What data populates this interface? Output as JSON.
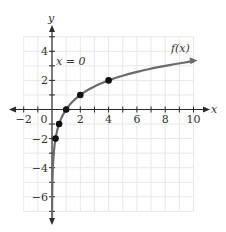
{
  "chart_data": {
    "type": "line",
    "title": "",
    "function_label": "f(x)",
    "asymptote_label": "x = 0",
    "xlabel": "x",
    "ylabel": "y",
    "xlim": [
      -2,
      10
    ],
    "ylim": [
      -7,
      5
    ],
    "x_ticks": [
      -2,
      -1,
      0,
      1,
      2,
      3,
      4,
      5,
      6,
      7,
      8,
      9,
      10
    ],
    "x_tick_labels": [
      "-2",
      "0",
      "2",
      "4",
      "6",
      "8",
      "10"
    ],
    "x_tick_label_values": [
      -2,
      0,
      2,
      4,
      6,
      8,
      10
    ],
    "y_ticks": [
      -7,
      -6,
      -5,
      -4,
      -3,
      -2,
      -1,
      0,
      1,
      2,
      3,
      4,
      5
    ],
    "y_tick_labels": [
      "4",
      "2",
      "-2",
      "-4",
      "-6"
    ],
    "y_tick_label_values": [
      4,
      2,
      -2,
      -4,
      -6
    ],
    "grid": true,
    "series": [
      {
        "name": "f(x)",
        "description": "logarithmic curve f(x) = log2(x)",
        "points": [
          {
            "x": 0.25,
            "y": -2
          },
          {
            "x": 0.5,
            "y": -1
          },
          {
            "x": 1,
            "y": 0
          },
          {
            "x": 2,
            "y": 1
          },
          {
            "x": 4,
            "y": 2
          }
        ],
        "end_point": {
          "x": 10,
          "y": 3.32
        },
        "color": "#6b6b6b"
      }
    ],
    "asymptote": {
      "type": "vertical",
      "x": 0
    }
  },
  "colors": {
    "grid": "#e8e8e8",
    "axis": "#2a2a2a",
    "curve": "#6b6b6b",
    "point": "#111111"
  }
}
